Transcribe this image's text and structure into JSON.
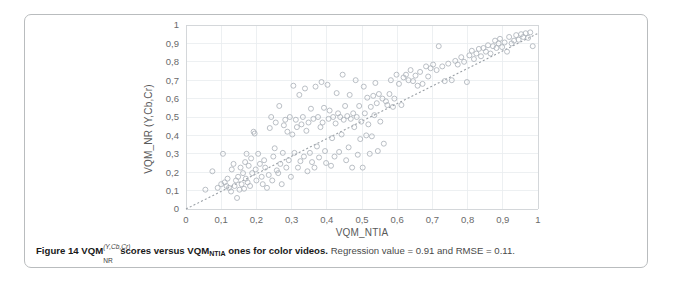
{
  "figure": {
    "caption": {
      "bold_prefix": "Figure 14 VQM",
      "superscript": "(Y,Cb,Cr)",
      "subscript": "NR",
      "bold_middle": "scores versus VQM",
      "bold_middle_sub": "NTIA",
      "bold_tail": "ones for color videos.",
      "regular_tail": "Regression value = 0.91 and RMSE = 0.11."
    }
  },
  "chart_data": {
    "type": "scatter",
    "title": "",
    "xlabel": "VQM_NTIA",
    "ylabel": "VQM_NR (Y,Cb,Cr)",
    "xlim": [
      0,
      1
    ],
    "ylim": [
      0,
      1
    ],
    "xticks": [
      "0",
      "0,1",
      "0,2",
      "0,3",
      "0,4",
      "0,5",
      "0,6",
      "0,7",
      "0,8",
      "0,9",
      "1"
    ],
    "yticks": [
      "0",
      "0,1",
      "0,2",
      "0,3",
      "0,4",
      "0,5",
      "0,6",
      "0,7",
      "0,8",
      "0,9",
      "1"
    ],
    "xtick_values": [
      0,
      0.1,
      0.2,
      0.3,
      0.4,
      0.5,
      0.6,
      0.7,
      0.8,
      0.9,
      1
    ],
    "ytick_values": [
      0,
      0.1,
      0.2,
      0.3,
      0.4,
      0.5,
      0.6,
      0.7,
      0.8,
      0.9,
      1
    ],
    "grid": true,
    "legend": false,
    "marker": "open-circle",
    "marker_color": "#aeb4bb",
    "regression_value": 0.91,
    "rmse": 0.11,
    "trendline": {
      "style": "dotted",
      "x": [
        0.0,
        1.0
      ],
      "y": [
        0.0,
        0.955
      ],
      "color": "#9aa0a6"
    },
    "series": [
      {
        "name": "color videos",
        "points": [
          [
            0.055,
            0.105
          ],
          [
            0.075,
            0.205
          ],
          [
            0.09,
            0.115
          ],
          [
            0.1,
            0.135
          ],
          [
            0.105,
            0.3
          ],
          [
            0.11,
            0.145
          ],
          [
            0.115,
            0.125
          ],
          [
            0.118,
            0.165
          ],
          [
            0.122,
            0.115
          ],
          [
            0.128,
            0.095
          ],
          [
            0.13,
            0.215
          ],
          [
            0.135,
            0.245
          ],
          [
            0.138,
            0.125
          ],
          [
            0.142,
            0.155
          ],
          [
            0.145,
            0.06
          ],
          [
            0.148,
            0.175
          ],
          [
            0.152,
            0.105
          ],
          [
            0.155,
            0.225
          ],
          [
            0.158,
            0.135
          ],
          [
            0.162,
            0.195
          ],
          [
            0.165,
            0.11
          ],
          [
            0.168,
            0.255
          ],
          [
            0.17,
            0.165
          ],
          [
            0.172,
            0.3
          ],
          [
            0.175,
            0.145
          ],
          [
            0.178,
            0.235
          ],
          [
            0.182,
            0.125
          ],
          [
            0.185,
            0.275
          ],
          [
            0.188,
            0.195
          ],
          [
            0.192,
            0.42
          ],
          [
            0.195,
            0.41
          ],
          [
            0.198,
            0.215
          ],
          [
            0.2,
            0.155
          ],
          [
            0.205,
            0.3
          ],
          [
            0.21,
            0.245
          ],
          [
            0.215,
            0.175
          ],
          [
            0.218,
            0.135
          ],
          [
            0.222,
            0.265
          ],
          [
            0.225,
            0.225
          ],
          [
            0.23,
            0.115
          ],
          [
            0.235,
            0.185
          ],
          [
            0.238,
            0.44
          ],
          [
            0.242,
            0.5
          ],
          [
            0.245,
            0.155
          ],
          [
            0.248,
            0.285
          ],
          [
            0.252,
            0.33
          ],
          [
            0.255,
            0.47
          ],
          [
            0.258,
            0.21
          ],
          [
            0.262,
            0.195
          ],
          [
            0.265,
            0.56
          ],
          [
            0.268,
            0.245
          ],
          [
            0.272,
            0.135
          ],
          [
            0.275,
            0.305
          ],
          [
            0.278,
            0.455
          ],
          [
            0.282,
            0.485
          ],
          [
            0.285,
            0.225
          ],
          [
            0.288,
            0.42
          ],
          [
            0.292,
            0.265
          ],
          [
            0.295,
            0.5
          ],
          [
            0.298,
            0.175
          ],
          [
            0.302,
            0.405
          ],
          [
            0.305,
            0.67
          ],
          [
            0.308,
            0.305
          ],
          [
            0.312,
            0.485
          ],
          [
            0.315,
            0.445
          ],
          [
            0.318,
            0.225
          ],
          [
            0.322,
            0.62
          ],
          [
            0.325,
            0.26
          ],
          [
            0.328,
            0.46
          ],
          [
            0.332,
            0.5
          ],
          [
            0.335,
            0.285
          ],
          [
            0.338,
            0.655
          ],
          [
            0.342,
            0.425
          ],
          [
            0.345,
            0.205
          ],
          [
            0.348,
            0.47
          ],
          [
            0.352,
            0.305
          ],
          [
            0.355,
            0.545
          ],
          [
            0.358,
            0.255
          ],
          [
            0.362,
            0.49
          ],
          [
            0.365,
            0.225
          ],
          [
            0.368,
            0.665
          ],
          [
            0.372,
            0.34
          ],
          [
            0.375,
            0.5
          ],
          [
            0.378,
            0.28
          ],
          [
            0.382,
            0.445
          ],
          [
            0.385,
            0.69
          ],
          [
            0.388,
            0.47
          ],
          [
            0.392,
            0.55
          ],
          [
            0.395,
            0.315
          ],
          [
            0.398,
            0.25
          ],
          [
            0.402,
            0.675
          ],
          [
            0.405,
            0.49
          ],
          [
            0.408,
            0.535
          ],
          [
            0.412,
            0.235
          ],
          [
            0.415,
            0.385
          ],
          [
            0.418,
            0.5
          ],
          [
            0.422,
            0.285
          ],
          [
            0.425,
            0.465
          ],
          [
            0.428,
            0.63
          ],
          [
            0.432,
            0.52
          ],
          [
            0.435,
            0.31
          ],
          [
            0.438,
            0.5
          ],
          [
            0.442,
            0.405
          ],
          [
            0.445,
            0.73
          ],
          [
            0.448,
            0.485
          ],
          [
            0.452,
            0.56
          ],
          [
            0.455,
            0.265
          ],
          [
            0.458,
            0.505
          ],
          [
            0.462,
            0.335
          ],
          [
            0.465,
            0.62
          ],
          [
            0.468,
            0.49
          ],
          [
            0.472,
            0.225
          ],
          [
            0.475,
            0.52
          ],
          [
            0.478,
            0.445
          ],
          [
            0.482,
            0.7
          ],
          [
            0.485,
            0.5
          ],
          [
            0.488,
            0.295
          ],
          [
            0.492,
            0.56
          ],
          [
            0.495,
            0.38
          ],
          [
            0.498,
            0.475
          ],
          [
            0.502,
            0.225
          ],
          [
            0.505,
            0.665
          ],
          [
            0.508,
            0.52
          ],
          [
            0.512,
            0.4
          ],
          [
            0.515,
            0.605
          ],
          [
            0.518,
            0.46
          ],
          [
            0.522,
            0.3
          ],
          [
            0.525,
            0.555
          ],
          [
            0.528,
            0.395
          ],
          [
            0.532,
            0.615
          ],
          [
            0.535,
            0.51
          ],
          [
            0.538,
            0.685
          ],
          [
            0.542,
            0.575
          ],
          [
            0.545,
            0.315
          ],
          [
            0.548,
            0.625
          ],
          [
            0.552,
            0.475
          ],
          [
            0.558,
            0.6
          ],
          [
            0.562,
            0.355
          ],
          [
            0.568,
            0.585
          ],
          [
            0.572,
            0.565
          ],
          [
            0.578,
            0.625
          ],
          [
            0.582,
            0.7
          ],
          [
            0.588,
            0.555
          ],
          [
            0.592,
            0.6
          ],
          [
            0.598,
            0.73
          ],
          [
            0.605,
            0.68
          ],
          [
            0.612,
            0.565
          ],
          [
            0.618,
            0.715
          ],
          [
            0.625,
            0.73
          ],
          [
            0.632,
            0.7
          ],
          [
            0.638,
            0.755
          ],
          [
            0.645,
            0.695
          ],
          [
            0.652,
            0.725
          ],
          [
            0.658,
            0.67
          ],
          [
            0.665,
            0.745
          ],
          [
            0.672,
            0.68
          ],
          [
            0.682,
            0.775
          ],
          [
            0.688,
            0.72
          ],
          [
            0.695,
            0.765
          ],
          [
            0.702,
            0.785
          ],
          [
            0.712,
            0.755
          ],
          [
            0.718,
            0.885
          ],
          [
            0.728,
            0.775
          ],
          [
            0.735,
            0.695
          ],
          [
            0.745,
            0.79
          ],
          [
            0.755,
            0.7
          ],
          [
            0.765,
            0.805
          ],
          [
            0.772,
            0.785
          ],
          [
            0.782,
            0.825
          ],
          [
            0.79,
            0.8
          ],
          [
            0.798,
            0.69
          ],
          [
            0.805,
            0.835
          ],
          [
            0.812,
            0.86
          ],
          [
            0.818,
            0.815
          ],
          [
            0.825,
            0.845
          ],
          [
            0.832,
            0.87
          ],
          [
            0.838,
            0.83
          ],
          [
            0.845,
            0.875
          ],
          [
            0.852,
            0.855
          ],
          [
            0.858,
            0.89
          ],
          [
            0.865,
            0.845
          ],
          [
            0.872,
            0.885
          ],
          [
            0.878,
            0.915
          ],
          [
            0.882,
            0.875
          ],
          [
            0.888,
            0.9
          ],
          [
            0.892,
            0.925
          ],
          [
            0.898,
            0.88
          ],
          [
            0.905,
            0.905
          ],
          [
            0.912,
            0.855
          ],
          [
            0.918,
            0.935
          ],
          [
            0.925,
            0.9
          ],
          [
            0.932,
            0.915
          ],
          [
            0.938,
            0.945
          ],
          [
            0.945,
            0.92
          ],
          [
            0.952,
            0.95
          ],
          [
            0.958,
            0.935
          ],
          [
            0.965,
            0.955
          ],
          [
            0.972,
            0.93
          ],
          [
            0.978,
            0.96
          ],
          [
            0.985,
            0.885
          ]
        ]
      }
    ]
  }
}
